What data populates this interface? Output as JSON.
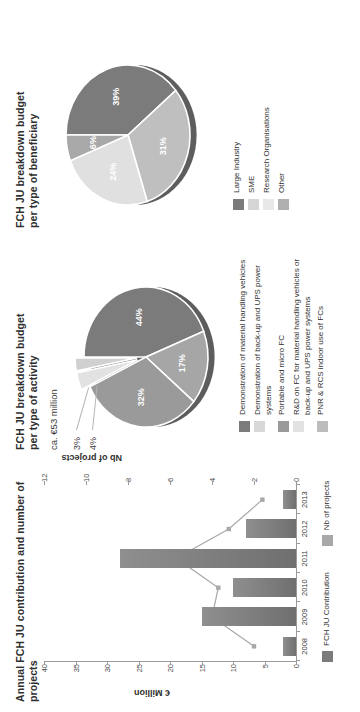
{
  "chart_data": [
    {
      "type": "bar",
      "title": "Annual FCH JU contribution and number of projects",
      "categories": [
        "2008",
        "2009",
        "2010",
        "2011",
        "2012",
        "2013"
      ],
      "xlabel": "",
      "ylabel": "€ Million",
      "ylabel2": "Nb of projects",
      "ylim": [
        0,
        40
      ],
      "yticks": [
        0,
        5,
        10,
        15,
        20,
        25,
        30,
        35,
        40
      ],
      "ylim2": [
        0,
        12
      ],
      "yticks2": [
        0,
        2,
        4,
        6,
        8,
        10,
        12
      ],
      "grid": false,
      "legend_position": "bottom",
      "series": [
        {
          "name": "FCH JU Contribution",
          "kind": "bar",
          "axis": "left",
          "color": "#7b7b7b",
          "values": [
            2.0,
            15.0,
            10.0,
            28.0,
            8.0,
            2.0
          ]
        },
        {
          "name": "Nb of projects",
          "kind": "line",
          "axis": "right",
          "color": "#a8a8a8",
          "values": [
            2,
            4,
            3.7,
            5.7,
            3.2,
            1.6
          ]
        }
      ]
    },
    {
      "type": "pie",
      "title": "FCH JU breakdown budget per type of activity",
      "note": "ca. €53 million",
      "labels": [
        "44%",
        "17%",
        "32%",
        "4%",
        "3%"
      ],
      "values": [
        44,
        17,
        32,
        4,
        3
      ],
      "colors": [
        "#7b7b7b",
        "#a6a6a6",
        "#9a9a9a",
        "#e2e2e2",
        "#d0d0d0"
      ],
      "legend_position": "right",
      "legend": [
        {
          "label": "Demonstration of material handling vehicles",
          "color": "#7b7b7b"
        },
        {
          "label": "Demonstration of back-up and UPS power systems",
          "color": "#d8d8d8"
        },
        {
          "label": "Portable and micro FC",
          "color": "#9a9a9a"
        },
        {
          "label": "R&D on FC for material handling vehicles or back-up and UPS power systems",
          "color": "#e2e2e2"
        },
        {
          "label": "PNR & RCS  indoor use of FCs",
          "color": "#bcbcbc"
        }
      ]
    },
    {
      "type": "pie",
      "title": "FCH JU breakdown budget per type of beneficiary",
      "note": "",
      "labels": [
        "39%",
        "31%",
        "24%",
        "6%"
      ],
      "values": [
        39,
        31,
        24,
        6
      ],
      "colors": [
        "#7b7b7b",
        "#bfbfbf",
        "#e0e0e0",
        "#a8a8a8"
      ],
      "legend_position": "right",
      "legend": [
        {
          "label": "Large Industry",
          "color": "#7b7b7b"
        },
        {
          "label": "SME",
          "color": "#d5d5d5"
        },
        {
          "label": "Research Organisations",
          "color": "#e8e8e8"
        },
        {
          "label": "Other",
          "color": "#b0b0b0"
        }
      ]
    }
  ],
  "bar_chart": {
    "title": "Annual FCH JU contribution and number of projects",
    "ylabel": "€ Million",
    "ylabel2": "Nb of projects",
    "yticks": [
      "0",
      "5",
      "10",
      "15",
      "20",
      "25",
      "30",
      "35",
      "40"
    ],
    "yticks2": [
      "0",
      "2",
      "4",
      "6",
      "8",
      "10",
      "12"
    ],
    "categories": [
      "2008",
      "2009",
      "2010",
      "2011",
      "2012",
      "2013"
    ],
    "legend": [
      "FCH JU Contribution",
      "Nb of projects"
    ]
  },
  "activity_pie": {
    "title": "FCH JU breakdown budget per type of activity",
    "note": "ca. €53 million",
    "slice_labels": [
      "44%",
      "17%",
      "32%"
    ],
    "leader_labels": [
      "4%",
      "3%"
    ],
    "legend": [
      "Demonstration of material handling vehicles",
      "Demonstration of back-up and UPS power systems",
      "Portable and micro FC",
      "R&D on FC for material handling vehicles or back-up and UPS power systems",
      "PNR & RCS  indoor use of FCs"
    ]
  },
  "beneficiary_pie": {
    "title": "FCH JU breakdown budget per type of beneficiary",
    "slice_labels": [
      "39%",
      "31%",
      "24%",
      "6%"
    ],
    "legend": [
      "Large Industry",
      "SME",
      "Research Organisations",
      "Other"
    ]
  }
}
